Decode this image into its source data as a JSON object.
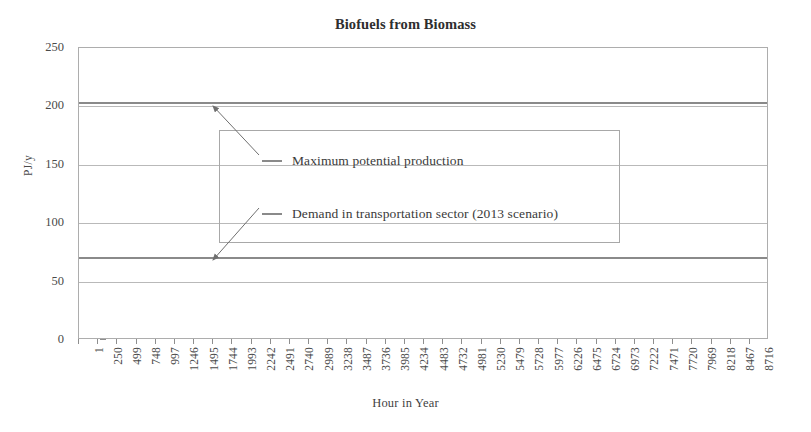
{
  "chart_data": {
    "type": "line",
    "title": "Biofuels from Biomass",
    "xlabel": "Hour in Year",
    "ylabel": "PJ/y",
    "ylim": [
      0,
      250
    ],
    "y_ticks": [
      0,
      50,
      100,
      150,
      200,
      250
    ],
    "grid": true,
    "legend_position": "inside-center",
    "x": [
      1,
      250,
      499,
      748,
      997,
      1246,
      1495,
      1744,
      1993,
      2242,
      2491,
      2740,
      2989,
      3238,
      3487,
      3736,
      3985,
      4234,
      4483,
      4732,
      4981,
      5230,
      5479,
      5728,
      5977,
      6226,
      6475,
      6724,
      6973,
      7222,
      7471,
      7720,
      7969,
      8218,
      8467,
      8716
    ],
    "x_tick_labels": [
      "1",
      "250",
      "499",
      "748",
      "997",
      "1246",
      "1495",
      "1744",
      "1993",
      "2242",
      "2491",
      "2740",
      "2989",
      "3238",
      "3487",
      "3736",
      "3985",
      "4234",
      "4483",
      "4732",
      "4981",
      "5230",
      "5479",
      "5728",
      "5977",
      "6226",
      "6475",
      "6724",
      "6973",
      "7222",
      "7471",
      "7720",
      "7969",
      "8218",
      "8467",
      "8716"
    ],
    "series": [
      {
        "name": "Maximum potential production",
        "constant_value": 203,
        "color": "#8a8a8a",
        "values": [
          203,
          203,
          203,
          203,
          203,
          203,
          203,
          203,
          203,
          203,
          203,
          203,
          203,
          203,
          203,
          203,
          203,
          203,
          203,
          203,
          203,
          203,
          203,
          203,
          203,
          203,
          203,
          203,
          203,
          203,
          203,
          203,
          203,
          203,
          203,
          203
        ]
      },
      {
        "name": "Demand in transportation sector (2013 scenario)",
        "constant_value": 70,
        "color": "#8a8a8a",
        "values": [
          70,
          70,
          70,
          70,
          70,
          70,
          70,
          70,
          70,
          70,
          70,
          70,
          70,
          70,
          70,
          70,
          70,
          70,
          70,
          70,
          70,
          70,
          70,
          70,
          70,
          70,
          70,
          70,
          70,
          70,
          70,
          70,
          70,
          70,
          70,
          70
        ]
      }
    ],
    "annotations": [
      {
        "name": "arrow-to-max-production",
        "from_series": "Maximum potential production"
      },
      {
        "name": "arrow-to-demand",
        "from_series": "Demand in transportation sector (2013 scenario)"
      }
    ]
  },
  "legend": {
    "entries": [
      {
        "label": "Maximum potential production"
      },
      {
        "label": "Demand in transportation sector (2013 scenario)"
      }
    ]
  },
  "colors": {
    "series_line": "#8a8a8a",
    "gridline": "#b9b9b9",
    "frame": "#adadad",
    "text": "#3a3a3a"
  }
}
